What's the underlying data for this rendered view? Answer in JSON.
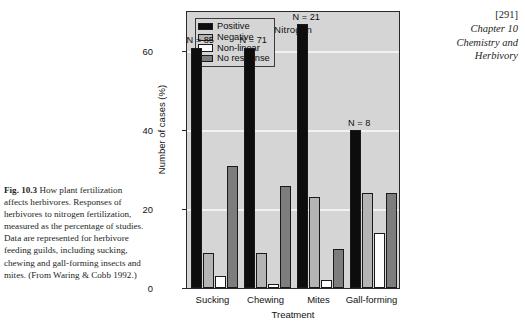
{
  "running_head": {
    "folio": "[291]",
    "lines": [
      "Chapter 10",
      "Chemistry and",
      "Herbivory"
    ]
  },
  "caption": {
    "figure_number": "Fig. 10.3",
    "text": "How plant fertilization affects herbivores. Responses of herbivores to nitrogen fertilization, measured as the percentage of studies. Data are represented for herbivore feeding guilds, including sucking, chewing and gall-forming insects and mites. (From Waring & Cobb 1992.)"
  },
  "chart_data": {
    "type": "bar",
    "title": "Nitrogen",
    "xlabel": "Treatment",
    "ylabel": "Number of cases (%)",
    "ylim": [
      0,
      70
    ],
    "yticks": [
      0,
      20,
      40,
      60
    ],
    "grid": true,
    "legend_position": "top-left",
    "categories": [
      "Sucking",
      "Chewing",
      "Mites",
      "Gall-forming"
    ],
    "group_annotations": [
      "N = 85",
      "N = 71",
      "N = 21",
      "N = 8"
    ],
    "series": [
      {
        "name": "Positive",
        "color": "#0d0d0d",
        "values": [
          61,
          61,
          67,
          40
        ]
      },
      {
        "name": "Negative",
        "color": "#b4b4b4",
        "values": [
          9,
          9,
          23,
          24
        ]
      },
      {
        "name": "Non-linear",
        "color": "#fdfdfd",
        "values": [
          3,
          1,
          2,
          14
        ]
      },
      {
        "name": "No response",
        "color": "#7d7d7d",
        "values": [
          31,
          26,
          10,
          24
        ]
      }
    ]
  }
}
